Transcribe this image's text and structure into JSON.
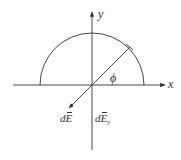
{
  "diagram": {
    "title": "",
    "colors": {
      "stroke": "#333333",
      "background": "#ffffff"
    },
    "axes": {
      "x_label": "x",
      "y_label": "y",
      "origin": [
        92,
        85
      ]
    },
    "semicircle": {
      "center": [
        92,
        85
      ],
      "radius": 52
    },
    "angle_label": "ϕ",
    "vectors": {
      "dE": {
        "prefix": "d",
        "symbol": "E",
        "sub": ""
      },
      "dEy": {
        "prefix": "d",
        "symbol": "E",
        "sub": "y"
      }
    }
  }
}
